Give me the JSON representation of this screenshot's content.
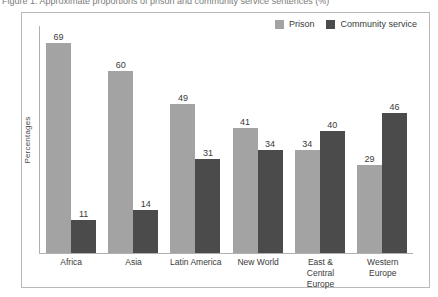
{
  "caption_sliver": "Figure 1. Approximate proportions of prison and community service sentences (%)",
  "figure": {
    "ylabel": "Percentages"
  },
  "legend": {
    "position": "top-right",
    "entries": [
      {
        "label": "Prison",
        "color": "#a3a3a3",
        "icon": "legend-swatch-icon"
      },
      {
        "label": "Community service",
        "color": "#4b4b4b",
        "icon": "legend-swatch-icon"
      }
    ]
  },
  "chart_data": {
    "type": "bar",
    "title": "",
    "xlabel": "",
    "ylabel": "Percentages",
    "ylim": [
      0,
      75
    ],
    "grid": false,
    "legend_position": "top-right",
    "categories": [
      "Africa",
      "Asia",
      "Latin America",
      "New World",
      "East &\nCentral\nEurope",
      "Western\nEurope"
    ],
    "series": [
      {
        "name": "Prison",
        "color": "#a3a3a3",
        "values": [
          69,
          60,
          49,
          41,
          34,
          29
        ]
      },
      {
        "name": "Community service",
        "color": "#4b4b4b",
        "values": [
          11,
          14,
          31,
          34,
          40,
          46
        ]
      }
    ]
  }
}
